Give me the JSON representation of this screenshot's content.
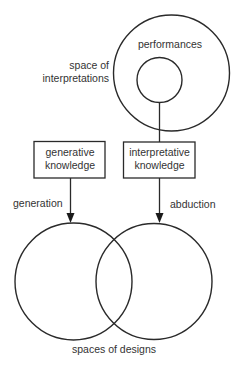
{
  "diagram": {
    "labels": {
      "performances": "performances",
      "space_of_line1": "space of",
      "space_of_line2": "interpretations",
      "generative_line1": "generative",
      "generative_line2": "knowledge",
      "interpretative_line1": "interpretative",
      "interpretative_line2": "knowledge",
      "generation": "generation",
      "abduction": "abduction",
      "spaces_of_designs": "spaces of designs"
    },
    "nodes": [
      {
        "id": "performances-circle",
        "type": "circle",
        "label": "performances"
      },
      {
        "id": "interpretations-circle",
        "type": "circle",
        "label": "space of interpretations"
      },
      {
        "id": "generative-knowledge-box",
        "type": "box",
        "label": "generative knowledge"
      },
      {
        "id": "interpretative-knowledge-box",
        "type": "box",
        "label": "interpretative knowledge"
      },
      {
        "id": "design-space-left",
        "type": "circle",
        "label": "spaces of designs"
      },
      {
        "id": "design-space-right",
        "type": "circle",
        "label": "spaces of designs"
      }
    ],
    "edges": [
      {
        "from": "interpretations-circle",
        "to": "interpretative-knowledge-box",
        "label": ""
      },
      {
        "from": "generative-knowledge-box",
        "to": "design-space-left",
        "label": "generation"
      },
      {
        "from": "interpretative-knowledge-box",
        "to": "design-space-right",
        "label": "abduction"
      }
    ],
    "colors": {
      "stroke": "#2a2a2a",
      "text": "#333333",
      "background": "#ffffff"
    }
  }
}
